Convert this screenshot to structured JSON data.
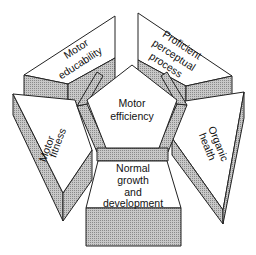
{
  "diagram": {
    "center": {
      "label_line1": "Motor",
      "label_line2": "efficiency"
    },
    "blocks": [
      {
        "id": "motor-educability",
        "line1": "Motor",
        "line2": "educability"
      },
      {
        "id": "proficient-perceptual-process",
        "line1": "Proficient",
        "line2": "perceptual",
        "line3": "process"
      },
      {
        "id": "organic-health",
        "line1": "Organic",
        "line2": "health"
      },
      {
        "id": "normal-growth-and-development",
        "line1": "Normal",
        "line2": "growth",
        "line3": "and",
        "line4": "development"
      },
      {
        "id": "motor-fitness",
        "line1": "Motor",
        "line2": "fitness"
      }
    ],
    "colors": {
      "face": "#ffffff",
      "shade": "#b8b8b8",
      "stroke": "#222222"
    }
  }
}
